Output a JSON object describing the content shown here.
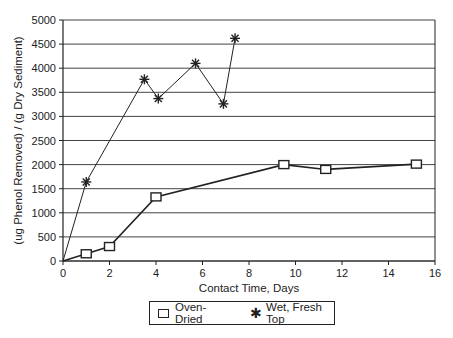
{
  "chart_data": {
    "type": "line",
    "title": "",
    "xlabel": "Contact Time, Days",
    "ylabel": "(ug Phenol Removed) / (g Dry Sediment)",
    "xlim": [
      0,
      16
    ],
    "ylim": [
      0,
      5000
    ],
    "xticks": [
      0,
      2,
      4,
      6,
      8,
      10,
      12,
      14,
      16
    ],
    "yticks": [
      0,
      500,
      1000,
      1500,
      2000,
      2500,
      3000,
      3500,
      4000,
      4500,
      5000
    ],
    "grid": "horizontal",
    "legend_position": "bottom",
    "series": [
      {
        "name": "Oven-Dried",
        "marker": "square",
        "x": [
          0,
          1,
          2,
          4,
          9.5,
          11.3,
          15.2
        ],
        "y": [
          0,
          150,
          300,
          1330,
          2000,
          1900,
          2010
        ]
      },
      {
        "name": "Wet, Fresh Top",
        "marker": "asterisk",
        "x": [
          0,
          1,
          3.5,
          4.1,
          5.7,
          6.9,
          7.4
        ],
        "y": [
          0,
          1640,
          3770,
          3370,
          4100,
          3260,
          4620
        ]
      }
    ]
  },
  "legend": {
    "items": [
      "Oven-Dried",
      "Wet, Fresh Top"
    ]
  }
}
